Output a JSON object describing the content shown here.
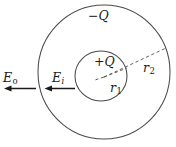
{
  "figure": {
    "background_color": "#ffffff",
    "stroke_color": "#3c3c3c",
    "text_color": "#1a1a1a",
    "width": 176,
    "height": 147
  },
  "shapes": {
    "outer_sphere": {
      "name": "outer-sphere",
      "center_x": 104,
      "center_y": 72,
      "radius": 66,
      "style": "solid",
      "charge_label": "−Q"
    },
    "inner_sphere": {
      "name": "inner-sphere",
      "center_x": 101,
      "center_y": 76,
      "radius": 26,
      "style": "solid",
      "charge_label": "+Q"
    }
  },
  "radii": [
    {
      "id": "r1",
      "symbol": "r",
      "subscript": "1",
      "from_x": 104,
      "from_y": 77,
      "to_x": 126,
      "to_y": 67,
      "style": "dashed",
      "describes": "radius to inner sphere surface"
    },
    {
      "id": "r2",
      "symbol": "r",
      "subscript": "2",
      "from_x": 104,
      "from_y": 77,
      "to_x": 166,
      "to_y": 48,
      "style": "dashed",
      "describes": "radius to outer sphere surface"
    }
  ],
  "fields": [
    {
      "id": "E_outer",
      "symbol": "E",
      "subscript": "o",
      "subscript_style": "roman",
      "arrow": {
        "tail_x": 36,
        "tail_y": 88,
        "head_x": 5,
        "head_y": 88,
        "direction": "left"
      },
      "region": "outside outer sphere"
    },
    {
      "id": "E_inner",
      "symbol": "E",
      "subscript": "i",
      "subscript_style": "italic",
      "arrow": {
        "tail_x": 75,
        "tail_y": 88,
        "head_x": 45,
        "head_y": 88,
        "direction": "left"
      },
      "region": "between inner and outer spheres"
    }
  ],
  "labels": {
    "minus_q": "−Q",
    "plus_q": "+Q",
    "e_outer_symbol": "E",
    "e_outer_sub": "o",
    "e_inner_symbol": "E",
    "e_inner_sub": "i",
    "r1_symbol": "r",
    "r1_sub": "1",
    "r2_symbol": "r",
    "r2_sub": "2"
  }
}
